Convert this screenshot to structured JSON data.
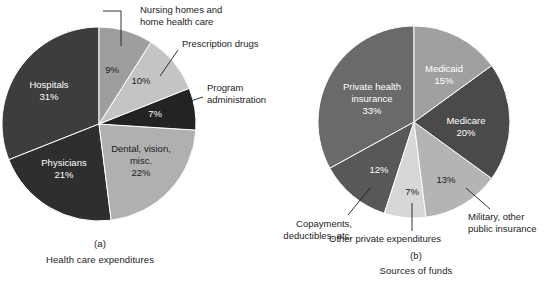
{
  "figure": {
    "background": "#ffffff",
    "text_color": "#1c1c1c",
    "label_on_dark_color": "#ffffff"
  },
  "panel_a": {
    "letter": "(a)",
    "caption": "Health care expenditures",
    "center": {
      "x": 99,
      "y": 124
    },
    "radius": 97,
    "callouts": [
      {
        "line1": "Nursing homes and",
        "line2": "home health care"
      },
      {
        "line1": "Prescription drugs",
        "line2": ""
      },
      {
        "line1": "Program",
        "line2": "administration"
      }
    ]
  },
  "panel_b": {
    "letter": "(b)",
    "caption": "Sources of funds",
    "center": {
      "x": 414,
      "y": 122
    },
    "radius": 96,
    "callouts": [
      {
        "line1": "Military, other",
        "line2": "public insurance"
      },
      {
        "line1": "Other private expenditures",
        "line2": ""
      },
      {
        "line1": "Copayments,",
        "line2": "deductibles, etc."
      }
    ]
  },
  "chart_data": [
    {
      "type": "pie",
      "title": "Health care expenditures",
      "panel": "(a)",
      "start_angle_deg": 0,
      "direction": "clockwise",
      "units": "percent",
      "total": 100,
      "legend": "none (labels drawn on and around slices)",
      "slices": [
        {
          "label": "Nursing homes and home health care",
          "value": 9,
          "value_label": "9%",
          "color": "#9e9e9e",
          "label_placement": "callout-above",
          "inner_text": "9%"
        },
        {
          "label": "Prescription drugs",
          "value": 10,
          "value_label": "10%",
          "color": "#c4c4c4",
          "label_placement": "callout-upper-right",
          "inner_text": "10%"
        },
        {
          "label": "Program administration",
          "value": 7,
          "value_label": "7%",
          "color": "#232323",
          "label_placement": "callout-right",
          "inner_text": "7%"
        },
        {
          "label": "Dental, vision, misc.",
          "value": 22,
          "value_label": "22%",
          "color": "#b0b0b0",
          "label_placement": "inside",
          "inner_text": "Dental, vision, misc. 22%"
        },
        {
          "label": "Physicians",
          "value": 21,
          "value_label": "21%",
          "color": "#2e2e2e",
          "label_placement": "inside",
          "inner_text": "Physicians 21%"
        },
        {
          "label": "Hospitals",
          "value": 31,
          "value_label": "31%",
          "color": "#3d3d3d",
          "label_placement": "inside",
          "inner_text": "Hospitals 31%"
        }
      ]
    },
    {
      "type": "pie",
      "title": "Sources of funds",
      "panel": "(b)",
      "start_angle_deg": 0,
      "direction": "clockwise",
      "units": "percent",
      "total": 100,
      "legend": "none (labels drawn on and around slices)",
      "slices": [
        {
          "label": "Medicaid",
          "value": 15,
          "value_label": "15%",
          "color": "#a0a0a0",
          "label_placement": "inside",
          "inner_text": "Medicaid 15%"
        },
        {
          "label": "Medicare",
          "value": 20,
          "value_label": "20%",
          "color": "#4a4a4a",
          "label_placement": "inside",
          "inner_text": "Medicare 20%"
        },
        {
          "label": "Military, other public insurance",
          "value": 13,
          "value_label": "13%",
          "color": "#b4b4b4",
          "label_placement": "callout-lower-right",
          "inner_text": "13%"
        },
        {
          "label": "Other private expenditures",
          "value": 7,
          "value_label": "7%",
          "color": "#d7d7d7",
          "label_placement": "callout-below",
          "inner_text": "7%"
        },
        {
          "label": "Copayments, deductibles, etc.",
          "value": 12,
          "value_label": "12%",
          "color": "#585858",
          "label_placement": "callout-lower-left",
          "inner_text": "12%"
        },
        {
          "label": "Private health insurance",
          "value": 33,
          "value_label": "33%",
          "color": "#6a6a6a",
          "label_placement": "inside",
          "inner_text": "Private health insurance 33%"
        }
      ]
    }
  ]
}
